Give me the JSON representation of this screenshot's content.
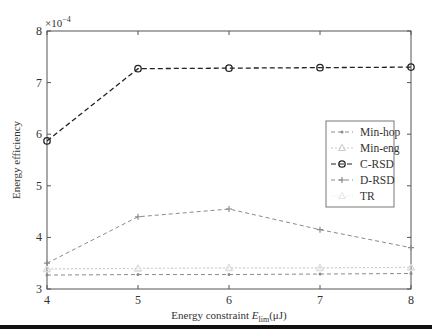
{
  "chart_data": {
    "type": "line",
    "title": "",
    "xlabel": "Energy constraint E_lim(μJ)",
    "xlabel_main": "Energy constraint ",
    "xlabel_var": "E",
    "xlabel_sub": "lim",
    "xlabel_unit": "(μJ)",
    "ylabel": "Energy efficiency",
    "y_multiplier": "×10",
    "y_multiplier_exp": "−4",
    "x": [
      4,
      5,
      6,
      7,
      8
    ],
    "xlim": [
      4,
      8
    ],
    "ylim": [
      3,
      8
    ],
    "xticks": [
      "4",
      "5",
      "6",
      "7",
      "8"
    ],
    "yticks": [
      "3",
      "4",
      "5",
      "6",
      "7",
      "8"
    ],
    "grid": false,
    "legend_position": "right, middle",
    "series": [
      {
        "name": "Min-hop",
        "values": [
          3.27,
          3.28,
          3.28,
          3.29,
          3.3
        ],
        "color": "#8a8a8a",
        "dash": "4,3",
        "marker": "dot"
      },
      {
        "name": "Min-eng",
        "values": [
          3.39,
          3.4,
          3.41,
          3.41,
          3.42
        ],
        "color": "#c8c8c8",
        "dash": "2,2",
        "marker": "triangle"
      },
      {
        "name": "C-RSD",
        "values": [
          5.87,
          7.27,
          7.28,
          7.29,
          7.3
        ],
        "color": "#222222",
        "dash": "5,3",
        "marker": "circle"
      },
      {
        "name": "D-RSD",
        "values": [
          3.5,
          4.4,
          4.55,
          4.15,
          3.8
        ],
        "color": "#8a8a8a",
        "dash": "4,3",
        "marker": "plus"
      },
      {
        "name": "TR",
        "values": [
          3.38,
          3.39,
          3.4,
          3.4,
          3.41
        ],
        "color": "#e4e4e4",
        "dash": "1,2",
        "marker": "triangle"
      }
    ]
  }
}
